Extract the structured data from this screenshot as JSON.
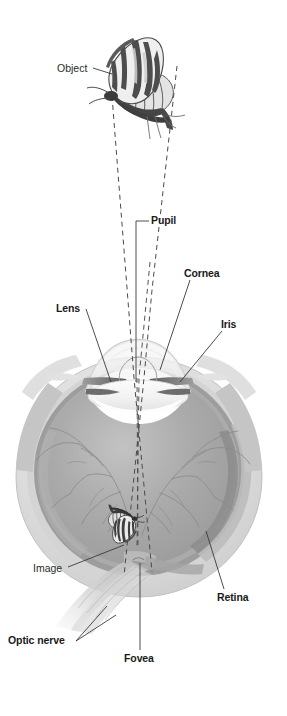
{
  "figure": {
    "background_color": "#ffffff",
    "width": 287,
    "height": 716
  },
  "labels": {
    "object": "Object",
    "pupil": "Pupil",
    "cornea": "Cornea",
    "lens": "Lens",
    "iris": "Iris",
    "image": "Image",
    "retina": "Retina",
    "optic_nerve": "Optic nerve",
    "fovea": "Fovea"
  },
  "colors": {
    "text": "#1a1a1a",
    "text_light": "#2b2b2b",
    "leader_line": "#3a3a3a",
    "ray_dashed": "#4a4a4a",
    "sclera_outer": "#d9d9d9",
    "sclera_mid": "#c6c6c6",
    "vitreous": "#a8a8a8",
    "vitreous_light": "#bcbcbc",
    "retina_band": "#909090",
    "choroid": "#8a8a8a",
    "vessel": "#8d8d8d",
    "iris_dark": "#6f6f6f",
    "cornea_line": "#cfcfcf",
    "optic_nerve": "#cdcdcd",
    "butterfly_dark": "#4d4d4d",
    "butterfly_mid": "#8f8f8f",
    "butterfly_light": "#cccccc"
  },
  "diagram": {
    "type": "anatomical-cross-section",
    "object_depicted": "swallowtail butterfly",
    "image_depicted": "inverted swallowtail butterfly on retina",
    "rays": [
      {
        "name": "ray-left-outer",
        "from": [
          111,
          96
        ],
        "to": [
          152,
          572
        ]
      },
      {
        "name": "ray-right-outer",
        "from": [
          176,
          66
        ],
        "to": [
          124,
          576
        ]
      },
      {
        "name": "ray-chief-left",
        "from": [
          132,
          330
        ],
        "to": [
          136,
          546
        ]
      },
      {
        "name": "ray-chief-right",
        "from": [
          143,
          332
        ],
        "to": [
          138,
          548
        ]
      }
    ]
  }
}
